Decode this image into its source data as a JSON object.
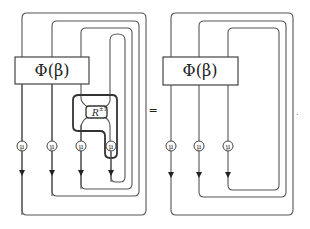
{
  "left_diagram": {
    "box_label": "Φ(β)",
    "r_label": "R",
    "r_exponent": "±1",
    "node_labels": [
      "μ",
      "μ",
      "μ",
      "μ"
    ]
  },
  "equals_sign": "=",
  "right_diagram": {
    "box_label": "Φ(β)",
    "node_labels": [
      "μ",
      "μ",
      "μ"
    ]
  },
  "trailing_period": "."
}
